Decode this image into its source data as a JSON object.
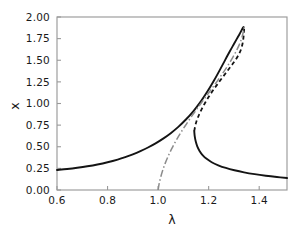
{
  "chart_data": {
    "type": "line",
    "title": "",
    "subtitle": "",
    "xlabel": "λ",
    "ylabel": "x",
    "xlim": [
      0.6,
      1.51
    ],
    "ylim": [
      0.0,
      2.0
    ],
    "xticks": [
      "0.6",
      "0.8",
      "1.0",
      "1.2",
      "1.4"
    ],
    "xtick_values": [
      0.6,
      0.8,
      1.0,
      1.2,
      1.4
    ],
    "yticks": [
      "0.00",
      "0.25",
      "0.50",
      "0.75",
      "1.00",
      "1.25",
      "1.50",
      "1.75",
      "2.00"
    ],
    "ytick_values": [
      0.0,
      0.25,
      0.5,
      0.75,
      1.0,
      1.25,
      1.5,
      1.75,
      2.0
    ],
    "grid": false,
    "legend": null,
    "legend_position": "none",
    "annotations": [],
    "colors": {
      "solid": "#141414",
      "dashed": "#141414",
      "dashdot": "#8c8c8c",
      "frame": "#9a9a9a",
      "background": "#ffffff"
    },
    "series": [
      {
        "name": "lower-stable-branch",
        "style": "solid",
        "color": "#141414",
        "points": [
          [
            0.6,
            0.232
          ],
          [
            0.64,
            0.243
          ],
          [
            0.68,
            0.257
          ],
          [
            0.72,
            0.274
          ],
          [
            0.76,
            0.295
          ],
          [
            0.8,
            0.321
          ],
          [
            0.84,
            0.352
          ],
          [
            0.87,
            0.38
          ],
          [
            0.9,
            0.412
          ],
          [
            0.93,
            0.449
          ],
          [
            0.96,
            0.491
          ],
          [
            0.99,
            0.539
          ],
          [
            1.02,
            0.594
          ],
          [
            1.05,
            0.657
          ],
          [
            1.08,
            0.73
          ],
          [
            1.11,
            0.815
          ],
          [
            1.14,
            0.913
          ],
          [
            1.17,
            1.028
          ],
          [
            1.195,
            1.138
          ],
          [
            1.22,
            1.26
          ],
          [
            1.245,
            1.392
          ],
          [
            1.265,
            1.502
          ],
          [
            1.285,
            1.61
          ],
          [
            1.3,
            1.688
          ],
          [
            1.312,
            1.75
          ],
          [
            1.322,
            1.8
          ],
          [
            1.33,
            1.845
          ],
          [
            1.335,
            1.872
          ],
          [
            1.338,
            1.885
          ]
        ]
      },
      {
        "name": "upper-fold-stable-branch",
        "style": "solid",
        "color": "#141414",
        "points": [
          [
            1.143,
            0.68
          ],
          [
            1.145,
            0.62
          ],
          [
            1.149,
            0.56
          ],
          [
            1.155,
            0.505
          ],
          [
            1.164,
            0.452
          ],
          [
            1.176,
            0.404
          ],
          [
            1.192,
            0.36
          ],
          [
            1.212,
            0.321
          ],
          [
            1.238,
            0.286
          ],
          [
            1.268,
            0.255
          ],
          [
            1.302,
            0.228
          ],
          [
            1.34,
            0.204
          ],
          [
            1.382,
            0.183
          ],
          [
            1.426,
            0.165
          ],
          [
            1.47,
            0.15
          ],
          [
            1.51,
            0.138
          ]
        ]
      },
      {
        "name": "unstable-dashed-branch",
        "style": "dashed",
        "color": "#141414",
        "points": [
          [
            1.143,
            0.68
          ],
          [
            1.147,
            0.742
          ],
          [
            1.153,
            0.805
          ],
          [
            1.162,
            0.87
          ],
          [
            1.173,
            0.938
          ],
          [
            1.186,
            1.008
          ],
          [
            1.201,
            1.08
          ],
          [
            1.218,
            1.155
          ],
          [
            1.237,
            1.232
          ],
          [
            1.257,
            1.31
          ],
          [
            1.277,
            1.388
          ],
          [
            1.296,
            1.462
          ],
          [
            1.313,
            1.535
          ],
          [
            1.326,
            1.61
          ],
          [
            1.334,
            1.69
          ],
          [
            1.338,
            1.77
          ],
          [
            1.34,
            1.84
          ],
          [
            1.341,
            1.888
          ]
        ]
      },
      {
        "name": "dash-dot-branch",
        "style": "dashdot",
        "color": "#8c8c8c",
        "points": [
          [
            1.0,
            0.0
          ],
          [
            1.004,
            0.07
          ],
          [
            1.01,
            0.145
          ],
          [
            1.018,
            0.225
          ],
          [
            1.028,
            0.308
          ],
          [
            1.04,
            0.392
          ],
          [
            1.054,
            0.478
          ],
          [
            1.07,
            0.566
          ],
          [
            1.088,
            0.655
          ],
          [
            1.108,
            0.746
          ],
          [
            1.13,
            0.84
          ],
          [
            1.153,
            0.935
          ],
          [
            1.177,
            1.032
          ],
          [
            1.202,
            1.13
          ],
          [
            1.227,
            1.23
          ],
          [
            1.251,
            1.33
          ],
          [
            1.274,
            1.43
          ],
          [
            1.295,
            1.53
          ],
          [
            1.313,
            1.628
          ],
          [
            1.327,
            1.722
          ],
          [
            1.336,
            1.812
          ],
          [
            1.341,
            1.888
          ]
        ]
      }
    ]
  },
  "axes": {
    "x_axis_name": "lambda-axis",
    "y_axis_name": "x-axis"
  }
}
